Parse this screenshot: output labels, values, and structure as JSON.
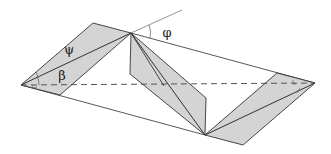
{
  "diagram": {
    "labels": {
      "psi": "ψ",
      "beta": "β",
      "phi": "φ"
    },
    "colors": {
      "panel_fill": "#d4d4d4",
      "line": "#333333",
      "thin_line": "#555555",
      "background": "#ffffff"
    },
    "elements": [
      "left-shaded-panel",
      "middle-shaded-panel",
      "right-shaded-panel",
      "outer-rhombus-outline",
      "dashed-horizontal-axis",
      "phi-angle-ray"
    ]
  }
}
